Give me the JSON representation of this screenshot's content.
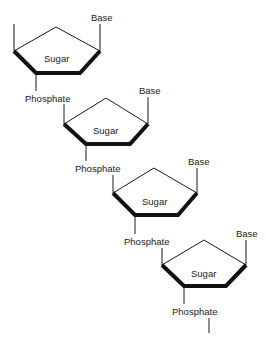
{
  "diagram": {
    "type": "DNA single strand sugar-phosphate backbone",
    "units": [
      {
        "sugar_label": "Sugar",
        "base_label": "Base",
        "phosphate_label": "Phosphate"
      },
      {
        "sugar_label": "Sugar",
        "base_label": "Base",
        "phosphate_label": "Phosphate"
      },
      {
        "sugar_label": "Sugar",
        "base_label": "Base",
        "phosphate_label": "Phosphate"
      },
      {
        "sugar_label": "Sugar",
        "base_label": "Base",
        "phosphate_label": "Phosphate"
      }
    ],
    "colors": {
      "stroke": "#1a1a1a",
      "background": "#ffffff"
    }
  }
}
